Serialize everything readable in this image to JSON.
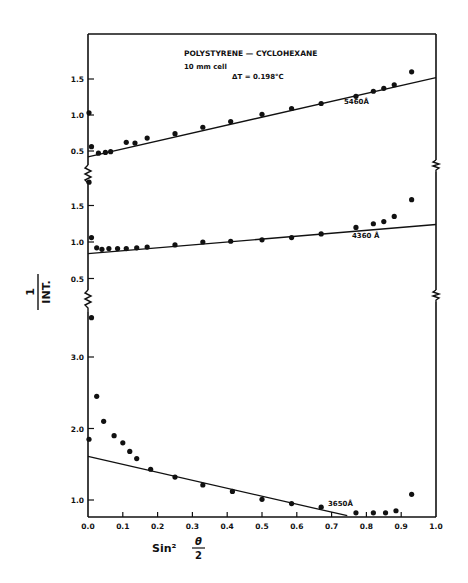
{
  "chart_data": {
    "type": "scatter",
    "title": "POLYSTYRENE — CYCLOHEXANE",
    "annotations": [
      "10 mm cell",
      "ΔT = 0.198°C"
    ],
    "xlabel": "Sin² θ/2",
    "ylabel": "1/INT.",
    "xlim": [
      0.0,
      1.0
    ],
    "x_ticks": [
      "0.0",
      "0.1",
      "0.2",
      "0.3",
      "0.4",
      "0.5",
      "0.6",
      "0.7",
      "0.8",
      "0.9",
      "1.0"
    ],
    "grid": false,
    "legend": "none (series labelled inline)",
    "panels": [
      {
        "name": "top",
        "series_label": "5460Å",
        "y_ticks": [
          "0.5",
          "1.0",
          "1.5"
        ],
        "ylim": [
          0.3,
          2.1
        ],
        "points": [
          [
            0.0,
            1.03
          ],
          [
            0.01,
            0.56
          ],
          [
            0.03,
            0.47
          ],
          [
            0.05,
            0.48
          ],
          [
            0.065,
            0.49
          ],
          [
            0.11,
            0.62
          ],
          [
            0.135,
            0.61
          ],
          [
            0.17,
            0.68
          ],
          [
            0.25,
            0.74
          ],
          [
            0.33,
            0.83
          ],
          [
            0.41,
            0.91
          ],
          [
            0.5,
            1.01
          ],
          [
            0.585,
            1.09
          ],
          [
            0.67,
            1.16
          ],
          [
            0.77,
            1.26
          ],
          [
            0.82,
            1.33
          ],
          [
            0.85,
            1.37
          ],
          [
            0.88,
            1.42
          ],
          [
            0.93,
            1.6
          ]
        ],
        "fit_line": {
          "x": [
            0.0,
            1.0
          ],
          "y": [
            0.42,
            1.52
          ]
        }
      },
      {
        "name": "middle",
        "series_label": "4360Å",
        "y_ticks": [
          "0.5",
          "1.0",
          "1.5"
        ],
        "ylim": [
          0.35,
          1.85
        ],
        "points": [
          [
            0.0,
            1.82
          ],
          [
            0.01,
            1.06
          ],
          [
            0.025,
            0.92
          ],
          [
            0.04,
            0.9
          ],
          [
            0.06,
            0.91
          ],
          [
            0.085,
            0.91
          ],
          [
            0.11,
            0.91
          ],
          [
            0.14,
            0.92
          ],
          [
            0.17,
            0.93
          ],
          [
            0.25,
            0.96
          ],
          [
            0.33,
            1.0
          ],
          [
            0.41,
            1.01
          ],
          [
            0.5,
            1.03
          ],
          [
            0.585,
            1.06
          ],
          [
            0.67,
            1.11
          ],
          [
            0.77,
            1.2
          ],
          [
            0.82,
            1.25
          ],
          [
            0.85,
            1.28
          ],
          [
            0.88,
            1.35
          ],
          [
            0.93,
            1.58
          ]
        ],
        "fit_line": {
          "x": [
            0.0,
            1.0
          ],
          "y": [
            0.84,
            1.24
          ]
        }
      },
      {
        "name": "bottom",
        "series_label": "3650Å",
        "y_ticks": [
          "1.0",
          "2.0",
          "3.0"
        ],
        "ylim": [
          0.78,
          3.95
        ],
        "points": [
          [
            0.0,
            1.85
          ],
          [
            0.01,
            3.55
          ],
          [
            0.025,
            2.45
          ],
          [
            0.045,
            2.1
          ],
          [
            0.075,
            1.9
          ],
          [
            0.1,
            1.8
          ],
          [
            0.12,
            1.68
          ],
          [
            0.14,
            1.58
          ],
          [
            0.18,
            1.43
          ],
          [
            0.25,
            1.32
          ],
          [
            0.33,
            1.21
          ],
          [
            0.415,
            1.12
          ],
          [
            0.5,
            1.01
          ],
          [
            0.585,
            0.95
          ],
          [
            0.67,
            0.9
          ],
          [
            0.77,
            0.82
          ],
          [
            0.82,
            0.82
          ],
          [
            0.855,
            0.82
          ],
          [
            0.885,
            0.85
          ],
          [
            0.93,
            1.08
          ]
        ],
        "fit_line": {
          "x": [
            0.0,
            0.745
          ],
          "y": [
            1.61,
            0.78
          ]
        }
      }
    ]
  },
  "text": {
    "title": "POLYSTYRENE — CYCLOHEXANE",
    "cell": "10 mm cell",
    "delta_t": "ΔT = 0.198°C",
    "series_top": "5460Å",
    "series_middle": "4360 Å",
    "series_bottom": "3650Å",
    "ylabel_num": "1",
    "ylabel_den": "INT.",
    "xlabel_sin": "Sin²",
    "xlabel_theta": "θ",
    "xlabel_two": "2"
  }
}
